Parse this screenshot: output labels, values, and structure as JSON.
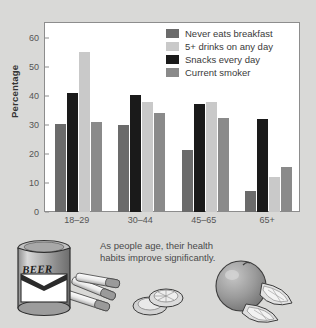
{
  "figure": {
    "background_color": "#d9d9d7",
    "plot_background_color": "#ffffff",
    "frame_color": "#8d8d8d"
  },
  "caption": {
    "line1": "As people age, their health",
    "line2": "habits improve significantly."
  },
  "illustration": {
    "beer_can_label": "BEER",
    "items": [
      "beer-can",
      "cigarettes",
      "lime-slices",
      "orange",
      "orange-wedges"
    ]
  },
  "chart_data": {
    "type": "bar",
    "title": "",
    "xlabel": "",
    "ylabel": "Percentage",
    "ylim": [
      0,
      65
    ],
    "yticks": [
      0,
      10,
      20,
      30,
      40,
      50,
      60
    ],
    "ytick_labels": [
      "0",
      "10",
      "20",
      "30",
      "40",
      "50",
      "60"
    ],
    "grid": false,
    "legend_position": "top-right",
    "categories": [
      "18–29",
      "30–44",
      "45–65",
      "65+"
    ],
    "series": [
      {
        "name": "Never eats breakfast",
        "color": "#6b6b6b",
        "values": [
          30.3,
          30.0,
          21.5,
          7.2
        ]
      },
      {
        "name": "5+ drinks on any day",
        "color": "#c9c9c9",
        "values": [
          55.0,
          38.0,
          38.0,
          12.0
        ]
      },
      {
        "name": "Snacks every day",
        "color": "#1a1a1a",
        "values": [
          41.0,
          40.2,
          37.0,
          32.0
        ]
      },
      {
        "name": "Current smoker",
        "color": "#8a8a8a",
        "values": [
          30.8,
          34.0,
          32.5,
          15.5
        ]
      }
    ],
    "bar_draw_order": [
      "Never eats breakfast",
      "Snacks every day",
      "5+ drinks on any day",
      "Current smoker"
    ]
  }
}
